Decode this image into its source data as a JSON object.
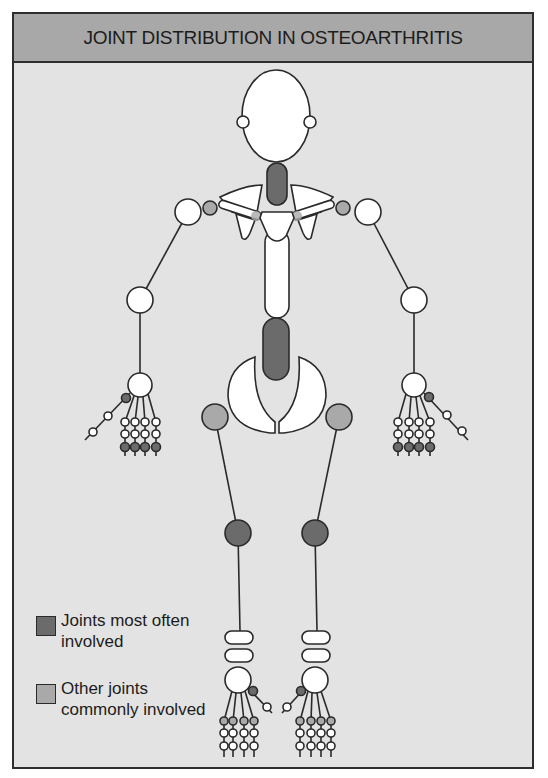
{
  "header": {
    "title": "JOINT DISTRIBUTION IN OSTEOARTHRITIS"
  },
  "colors": {
    "most_often": "#6b6b6b",
    "commonly": "#a9a9a9",
    "bone": "#ffffff",
    "background": "#e3e3e3",
    "header": "#a8a8a8",
    "outline": "#2a2a2a"
  },
  "legend": {
    "items": [
      {
        "label": "Joints most often involved",
        "color": "#6b6b6b"
      },
      {
        "label": "Other joints commonly involved",
        "color": "#a9a9a9"
      }
    ]
  },
  "joints": {
    "most_often_involved": [
      "cervical spine",
      "lumbar spine",
      "knees",
      "hand DIP joints",
      "thumb base (CMC)",
      "big toe (MTP)"
    ],
    "commonly_involved": [
      "hips",
      "acromioclavicular joints",
      "sternoclavicular joints",
      "foot MTP joints"
    ]
  }
}
